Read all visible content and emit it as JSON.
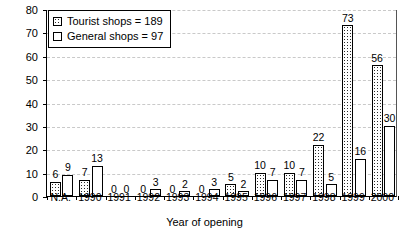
{
  "chart_data": {
    "type": "bar",
    "title": "",
    "xlabel": "Year of opening",
    "ylabel": "Number of shops",
    "ylim": [
      0,
      80
    ],
    "ytick_step": 10,
    "yticks": [
      0,
      10,
      20,
      30,
      40,
      50,
      60,
      70,
      80
    ],
    "grid": true,
    "legend_position": "top-left",
    "categories": [
      "N.A.",
      "1990",
      "1991",
      "1992",
      "1993",
      "1994",
      "1995",
      "1996",
      "1997",
      "1998",
      "1999",
      "2000"
    ],
    "series": [
      {
        "name": "Tourist shops = 189",
        "short_name": "Tourist shops",
        "total": 189,
        "fill": "dotted",
        "values": [
          6,
          7,
          0,
          0,
          0,
          0,
          5,
          10,
          10,
          22,
          73,
          56
        ]
      },
      {
        "name": "General shops = 97",
        "short_name": "General shops",
        "total": 97,
        "fill": "empty",
        "values": [
          9,
          13,
          0,
          3,
          2,
          3,
          2,
          7,
          7,
          5,
          16,
          30
        ]
      }
    ]
  },
  "legend": {
    "items": [
      {
        "label": "Tourist shops = 189",
        "swatch": "dotted"
      },
      {
        "label": "General shops = 97",
        "swatch": "empty"
      }
    ]
  },
  "colors": {
    "axis": "#000000",
    "grid": "#c9c9c9",
    "bar_outline": "#000000",
    "bar_fill": "#ffffff",
    "text": "#000000"
  }
}
